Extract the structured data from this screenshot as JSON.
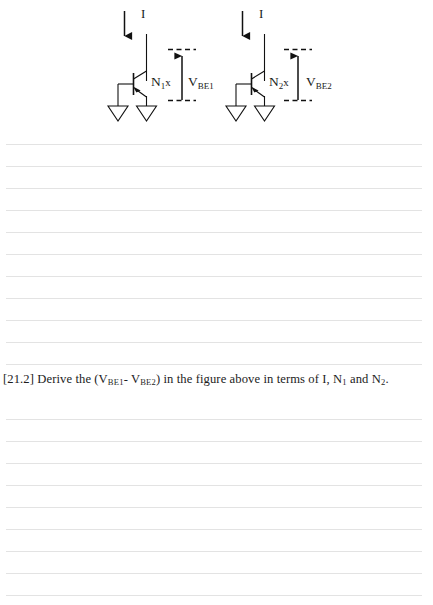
{
  "document": {
    "type": "ruled-worksheet-page",
    "background_color": "#ffffff",
    "rule_color": "#e3e3e3",
    "ink_color": "#1a1a1a"
  },
  "figure": {
    "name": "two-bjt-current-source-figure",
    "circuits": [
      {
        "id": "left",
        "current_label": "I",
        "device_label": "N",
        "device_label_sub": "1",
        "device_label_suffix": "x",
        "voltage_label": "V",
        "voltage_label_sub": "BE1",
        "ground_count": 2
      },
      {
        "id": "right",
        "current_label": "I",
        "device_label": "N",
        "device_label_sub": "2",
        "device_label_suffix": "x",
        "voltage_label": "V",
        "voltage_label_sub": "BE2",
        "ground_count": 2
      }
    ]
  },
  "question": {
    "number": "[21.2]",
    "text_1": "Derive the (V",
    "sub_1": "BE1",
    "text_2": "- V",
    "sub_2": "BE2",
    "text_3": ") in the figure above in terms of I, N",
    "sub_3": "1",
    "text_4": " and N",
    "sub_4": "2",
    "text_5": "."
  },
  "rules": {
    "top_section_y": [
      136,
      158,
      180,
      202,
      224,
      246,
      268,
      290,
      312,
      334,
      356
    ],
    "bottom_section_y": [
      411,
      433,
      455,
      477,
      499,
      521,
      543,
      565,
      587
    ],
    "left": 6,
    "width": 416
  }
}
